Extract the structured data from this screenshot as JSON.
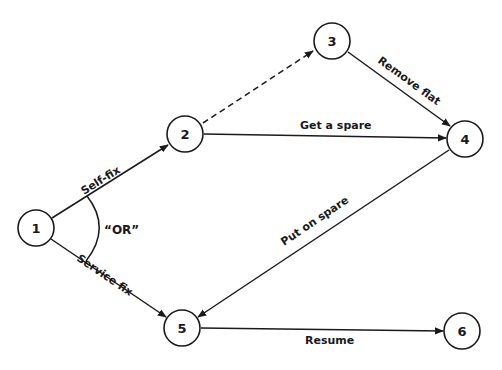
{
  "diagram": {
    "type": "activity-network",
    "colors": {
      "stroke": "#1a1a1a",
      "background": "#ffffff"
    },
    "nodes": [
      {
        "id": "1",
        "label": "1",
        "x": 36,
        "y": 228
      },
      {
        "id": "2",
        "label": "2",
        "x": 185,
        "y": 134
      },
      {
        "id": "3",
        "label": "3",
        "x": 332,
        "y": 41
      },
      {
        "id": "4",
        "label": "4",
        "x": 465,
        "y": 139
      },
      {
        "id": "5",
        "label": "5",
        "x": 182,
        "y": 328
      },
      {
        "id": "6",
        "label": "6",
        "x": 462,
        "y": 331
      }
    ],
    "edges": [
      {
        "from": "1",
        "to": "2",
        "label": "Self-fix",
        "style": "solid"
      },
      {
        "from": "1",
        "to": "5",
        "label": "Service fix",
        "style": "solid"
      },
      {
        "from": "2",
        "to": "3",
        "label": "",
        "style": "dashed"
      },
      {
        "from": "2",
        "to": "4",
        "label": "Get a spare",
        "style": "solid"
      },
      {
        "from": "3",
        "to": "4",
        "label": "Remove flat",
        "style": "solid"
      },
      {
        "from": "4",
        "to": "5",
        "label": "Put on spare",
        "style": "solid"
      },
      {
        "from": "5",
        "to": "6",
        "label": "Resume",
        "style": "solid"
      }
    ],
    "annotation": {
      "label": "“OR”"
    }
  }
}
